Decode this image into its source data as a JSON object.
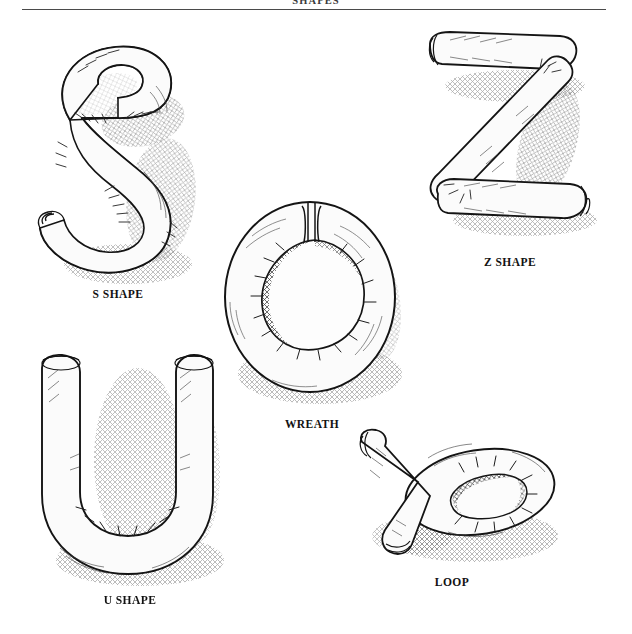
{
  "page": {
    "running_head": "SHAPES",
    "background_color": "#ffffff",
    "ink_color": "#1a1a1a",
    "rule_color": "#4a4a4a"
  },
  "figures": [
    {
      "id": "s-shape",
      "caption": "S SHAPE",
      "icon": "dough-s-shape-illustration",
      "description": "pen-and-ink drawing of a rolled dough rope curved into the letter S"
    },
    {
      "id": "z-shape",
      "caption": "Z SHAPE",
      "icon": "dough-z-shape-illustration",
      "description": "pen-and-ink drawing of a rolled dough rope folded into the letter Z"
    },
    {
      "id": "wreath",
      "caption": "WREATH",
      "icon": "dough-wreath-illustration",
      "description": "pen-and-ink drawing of a dough rope joined end to end forming a ring"
    },
    {
      "id": "u-shape",
      "caption": "U SHAPE",
      "icon": "dough-u-shape-illustration",
      "description": "pen-and-ink drawing of a rolled dough rope bent into the letter U"
    },
    {
      "id": "loop",
      "caption": "LOOP",
      "icon": "dough-loop-illustration",
      "description": "pen-and-ink drawing of a dough rope crossed over itself forming a loop"
    }
  ]
}
